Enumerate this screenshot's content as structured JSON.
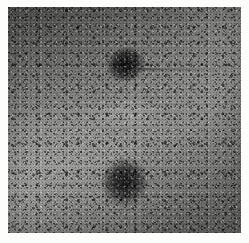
{
  "image": {
    "kind": "micrograph",
    "modality": "grayscale electron micrograph",
    "alt_text": "Grayscale micrograph showing a speckled granular field with two dark rounded bodies, one upper-centre and one lower-centre-left",
    "border": {
      "present": true,
      "color": "#fdfdfc",
      "left_px": 8,
      "top_px": 7,
      "right_px": 8,
      "bottom_px": 10
    },
    "plate": {
      "width_px": 233,
      "height_px": 226,
      "background_color": "#7b7b79",
      "mean_tone": "mid grey",
      "texture": "fine dark speckle / film grain"
    },
    "features": [
      {
        "id": "blob-upper",
        "label": "dark round body (upper)",
        "center_x": 120,
        "center_y": 66,
        "width_px": 42,
        "height_px": 38,
        "shape": "round",
        "tone": "very dark",
        "color": "#141414"
      },
      {
        "id": "blob-lower",
        "label": "dark round body (lower)",
        "center_x": 125,
        "center_y": 182,
        "width_px": 50,
        "height_px": 54,
        "shape": "oval, tilted",
        "tone": "dark",
        "color": "#1e1e1e"
      },
      {
        "id": "filament",
        "label": "faint horizontal filament",
        "start_x": 138,
        "start_y": 69,
        "end_x": 241,
        "end_y": 71,
        "tone": "faint dark line"
      },
      {
        "id": "striations",
        "label": "diagonal striations",
        "orientation_deg": -28,
        "tone": "faint dark streaks"
      },
      {
        "id": "halo",
        "label": "pale band below upper body",
        "center_x": 126,
        "center_y": 113,
        "tone": "light grey"
      }
    ],
    "palette": {
      "darkest": "#0c0c0c",
      "dark": "#2a2a2a",
      "mid": "#7b7b79",
      "light": "#9a9a97",
      "border": "#fdfdfc"
    }
  }
}
